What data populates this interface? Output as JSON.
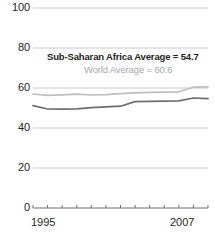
{
  "chart_data": {
    "type": "line",
    "title": "",
    "xlabel": "",
    "ylabel": "",
    "xlim": [
      1995,
      2007
    ],
    "ylim": [
      0,
      100
    ],
    "grid": true,
    "legend_position": "inline-annotation",
    "x": [
      1995,
      1996,
      1997,
      1998,
      1999,
      2000,
      2001,
      2002,
      2003,
      2004,
      2005,
      2006,
      2007
    ],
    "series": [
      {
        "name": "World Average",
        "color": "#bcbec0",
        "values": [
          57.0,
          56.3,
          56.6,
          56.9,
          56.5,
          56.7,
          57.2,
          57.6,
          57.8,
          57.9,
          58.1,
          60.4,
          60.6
        ]
      },
      {
        "name": "Sub-Saharan Africa Average",
        "color": "#6d6e71",
        "values": [
          51.2,
          49.5,
          49.4,
          49.6,
          50.2,
          50.6,
          50.9,
          53.2,
          53.3,
          53.4,
          53.6,
          55.0,
          54.7
        ]
      }
    ],
    "yticks": [
      {
        "value": 100,
        "label": "100"
      },
      {
        "value": 80,
        "label": "80"
      },
      {
        "value": 60,
        "label": "60"
      },
      {
        "value": 40,
        "label": "40"
      },
      {
        "value": 20,
        "label": "20"
      },
      {
        "value": 0,
        "label": "0"
      }
    ],
    "xticks": [
      {
        "value": 1995,
        "label": "1995"
      },
      {
        "value": 1996,
        "label": ""
      },
      {
        "value": 1997,
        "label": ""
      },
      {
        "value": 1998,
        "label": ""
      },
      {
        "value": 1999,
        "label": ""
      },
      {
        "value": 2000,
        "label": ""
      },
      {
        "value": 2001,
        "label": ""
      },
      {
        "value": 2002,
        "label": ""
      },
      {
        "value": 2003,
        "label": ""
      },
      {
        "value": 2004,
        "label": ""
      },
      {
        "value": 2005,
        "label": ""
      },
      {
        "value": 2006,
        "label": ""
      },
      {
        "value": 2007,
        "label": "2007"
      }
    ],
    "annotations": [
      {
        "id": "ssa-average",
        "text": "Sub-Saharan Africa Average = 54.7",
        "color": "#231f20",
        "bold": true
      },
      {
        "id": "world-average",
        "text": "World Average = 60.6",
        "color": "#a7a9ac",
        "bold": false
      }
    ]
  },
  "axis": {
    "y_labels": {
      "t100": "100",
      "t80": "80",
      "t60": "60",
      "t40": "40",
      "t20": "20",
      "t0": "0"
    },
    "x_labels": {
      "start": "1995",
      "end": "2007"
    }
  },
  "annotations": {
    "ssa": "Sub-Saharan Africa Average = 54.7",
    "world": "World Average = 60.6"
  },
  "colors": {
    "gridline": "#c9cacb",
    "axis": "#6d6e71",
    "series_world": "#bcbec0",
    "series_ssa": "#6d6e71",
    "text": "#231f20",
    "text_muted": "#a7a9ac",
    "background": "#ffffff"
  }
}
